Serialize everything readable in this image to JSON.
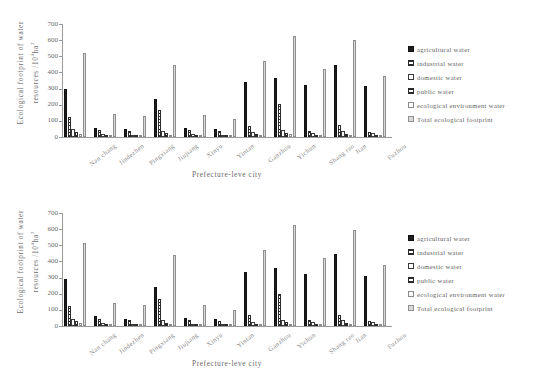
{
  "figures": [
    {
      "id": "chart-top",
      "xtitle": "Prefecture-leve city",
      "ytitle_line1": "Ecological footprint of water",
      "ytitle_line2": "resources /10",
      "ytitle_sup": "4",
      "ytitle_unit": "ha",
      "ytitle_unit_sup": "2"
    },
    {
      "id": "chart-bottom",
      "xtitle": "Prefecture-leve city",
      "ytitle_line1": "Ecological footprint of water",
      "ytitle_line2": "resources /10",
      "ytitle_sup": "4",
      "ytitle_unit": "ha",
      "ytitle_unit_sup": "2"
    }
  ],
  "legend": {
    "items": [
      {
        "label": "agricultural water",
        "key": "agricultural",
        "swatch": "solid-black"
      },
      {
        "label": "industrial water",
        "key": "industrial",
        "swatch": "hatched-dense"
      },
      {
        "label": "domestic water",
        "key": "domestic",
        "swatch": "open-white"
      },
      {
        "label": "public water",
        "key": "public",
        "swatch": "hatched-dense"
      },
      {
        "label": "ecological environment water",
        "key": "ecological_environment",
        "swatch": "open-light"
      },
      {
        "label": "Total ecological footprint",
        "key": "total",
        "swatch": "open-thick"
      }
    ]
  },
  "chart_data": [
    {
      "type": "bar",
      "title": "",
      "xlabel": "Prefecture-leve city",
      "ylabel": "Ecological footprint of water resources /10^4 ha^2",
      "ylim": [
        0,
        700
      ],
      "yticks": [
        0,
        100,
        200,
        300,
        400,
        500,
        600,
        700
      ],
      "grid": false,
      "legend_position": "right",
      "categories": [
        "Nan chang",
        "Jindezhen",
        "Pingxiang",
        "Jiujiang",
        "Xinyu",
        "Yintan",
        "Ganzhou",
        "Yichun",
        "Shang rao",
        "Jian",
        "Fuzhou"
      ],
      "series": [
        {
          "name": "agricultural water",
          "values": [
            295,
            58,
            48,
            238,
            55,
            48,
            338,
            363,
            322,
            447,
            318
          ]
        },
        {
          "name": "industrial water",
          "values": [
            125,
            45,
            38,
            170,
            42,
            36,
            70,
            205,
            38,
            72,
            30
          ]
        },
        {
          "name": "domestic water",
          "values": [
            48,
            18,
            14,
            40,
            16,
            14,
            28,
            42,
            26,
            38,
            24
          ]
        },
        {
          "name": "public water",
          "values": [
            30,
            10,
            8,
            22,
            10,
            8,
            16,
            24,
            14,
            20,
            12
          ]
        },
        {
          "name": "ecological environment water",
          "values": [
            20,
            6,
            5,
            14,
            6,
            5,
            10,
            16,
            9,
            13,
            8
          ]
        },
        {
          "name": "Total ecological footprint",
          "values": [
            518,
            140,
            132,
            446,
            136,
            113,
            470,
            628,
            423,
            600,
            378
          ]
        }
      ]
    },
    {
      "type": "bar",
      "title": "",
      "xlabel": "Prefecture-leve city",
      "ylabel": "Ecological footprint of water resources /10^4 ha^2",
      "ylim": [
        0,
        700
      ],
      "yticks": [
        0,
        100,
        200,
        300,
        400,
        500,
        600,
        700
      ],
      "grid": false,
      "legend_position": "right",
      "categories": [
        "Nan chang",
        "Jindezhen",
        "Pingxiang",
        "Jiujiang",
        "Xinyu",
        "Yintan",
        "Ganzhou",
        "Yichun",
        "Shang rao",
        "Jian",
        "Fuzhou"
      ],
      "series": [
        {
          "name": "agricultural water",
          "values": [
            292,
            60,
            46,
            240,
            52,
            46,
            333,
            362,
            320,
            445,
            312
          ]
        },
        {
          "name": "industrial water",
          "values": [
            122,
            44,
            36,
            168,
            40,
            34,
            66,
            200,
            36,
            70,
            28
          ]
        },
        {
          "name": "domestic water",
          "values": [
            46,
            17,
            13,
            38,
            15,
            13,
            26,
            40,
            24,
            36,
            22
          ]
        },
        {
          "name": "public water",
          "values": [
            29,
            10,
            8,
            21,
            10,
            8,
            15,
            23,
            13,
            19,
            11
          ]
        },
        {
          "name": "ecological environment water",
          "values": [
            19,
            6,
            5,
            13,
            6,
            5,
            9,
            15,
            8,
            12,
            7
          ]
        },
        {
          "name": "Total ecological footprint",
          "values": [
            515,
            140,
            130,
            443,
            128,
            102,
            468,
            625,
            420,
            595,
            375
          ]
        }
      ]
    }
  ]
}
